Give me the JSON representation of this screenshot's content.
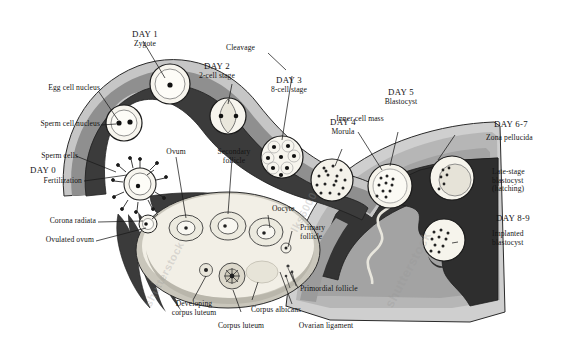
{
  "diagram": {
    "palette": {
      "background": "#ffffff",
      "tube_lumen_dark": "#3b3b3b",
      "tube_wall_mid": "#8f8f8f",
      "tube_wall_light": "#c6c6c6",
      "uterus_mid": "#a9a9a9",
      "uterus_light": "#cfcfcf",
      "endometrium_dark": "#343434",
      "ovary_fill": "#f2efe6",
      "cell_fill": "#f6f4ec",
      "outline": "#1a1a1a",
      "label_text": "#141414"
    },
    "watermarks": [
      "shutterstock",
      "lks6000"
    ]
  },
  "stages": [
    {
      "id": "day0",
      "day": "DAY 0",
      "name": "Fertilization"
    },
    {
      "id": "day1",
      "day": "DAY 1",
      "name": "Zygote"
    },
    {
      "id": "day2",
      "day": "DAY 2",
      "name": "2-cell stage"
    },
    {
      "id": "day3",
      "day": "DAY 3",
      "name": "8-cell stage"
    },
    {
      "id": "day4",
      "day": "DAY 4",
      "name": "Morula"
    },
    {
      "id": "day5",
      "day": "DAY 5",
      "name": "Blastocyst"
    },
    {
      "id": "day67",
      "day": "DAY 6-7",
      "name": "Zona pellucida"
    },
    {
      "id": "day89",
      "day": "DAY 8-9",
      "name": "Implanted blastocyst"
    }
  ],
  "labels": {
    "egg_cell_nucleus": "Egg cell nucleus",
    "sperm_cell_nucleus": "Sperm cell nucleus",
    "sperm_cells": "Sperm cells",
    "fertilization": "Fertilization",
    "corona_radiata": "Corona radiata",
    "ovulated_ovum": "Ovulated ovum",
    "ovum": "Ovum",
    "secondary_follicle": "Secondary\nfollicle",
    "oocyte": "Oocyte",
    "primary_follicle": "Primary\nfollicle",
    "primordial_follicle": "Primordial follicle",
    "developing_corpus_luteum": "Developing\ncorpus luteum",
    "corpus_luteum": "Corpus luteum",
    "corpus_albicans": "Corpus albicans",
    "ovarian_ligament": "Ovarian ligament",
    "cleavage": "Cleavage",
    "inner_cell_mass": "Inner cell mass",
    "late_stage_blastocyst": "Late-stage\nblastocyst\n(hatching)",
    "day0": "DAY 0",
    "day1": "DAY 1",
    "day1_sub": "Zygote",
    "day2": "DAY 2",
    "day2_sub": "2-cell stage",
    "day3": "DAY 3",
    "day3_sub": "8-cell stage",
    "day4": "DAY 4",
    "day4_sub": "Morula",
    "day5": "DAY 5",
    "day5_sub": "Blastocyst",
    "day67": "DAY 6-7",
    "day67_sub": "Zona pellucida",
    "day89": "DAY 8-9",
    "day89_sub": "Implanted\nblastocyst"
  },
  "watermark": {
    "brand": "shutterstock",
    "code": "lks6000"
  }
}
